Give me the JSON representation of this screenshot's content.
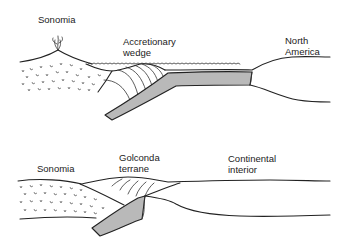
{
  "diagram": {
    "panels": [
      {
        "id": "top",
        "labels": {
          "sonomia": "Sonomia",
          "wedge_line1": "Accretionary",
          "wedge_line2": "wedge",
          "na_line1": "North",
          "na_line2": "America"
        }
      },
      {
        "id": "bottom",
        "labels": {
          "sonomia": "Sonomia",
          "golconda_line1": "Golconda",
          "golconda_line2": "terrane",
          "interior_line1": "Continental",
          "interior_line2": "interior"
        }
      }
    ],
    "colors": {
      "line": "#222222",
      "slab_fill": "#b9b9b9",
      "background": "#ffffff"
    }
  }
}
